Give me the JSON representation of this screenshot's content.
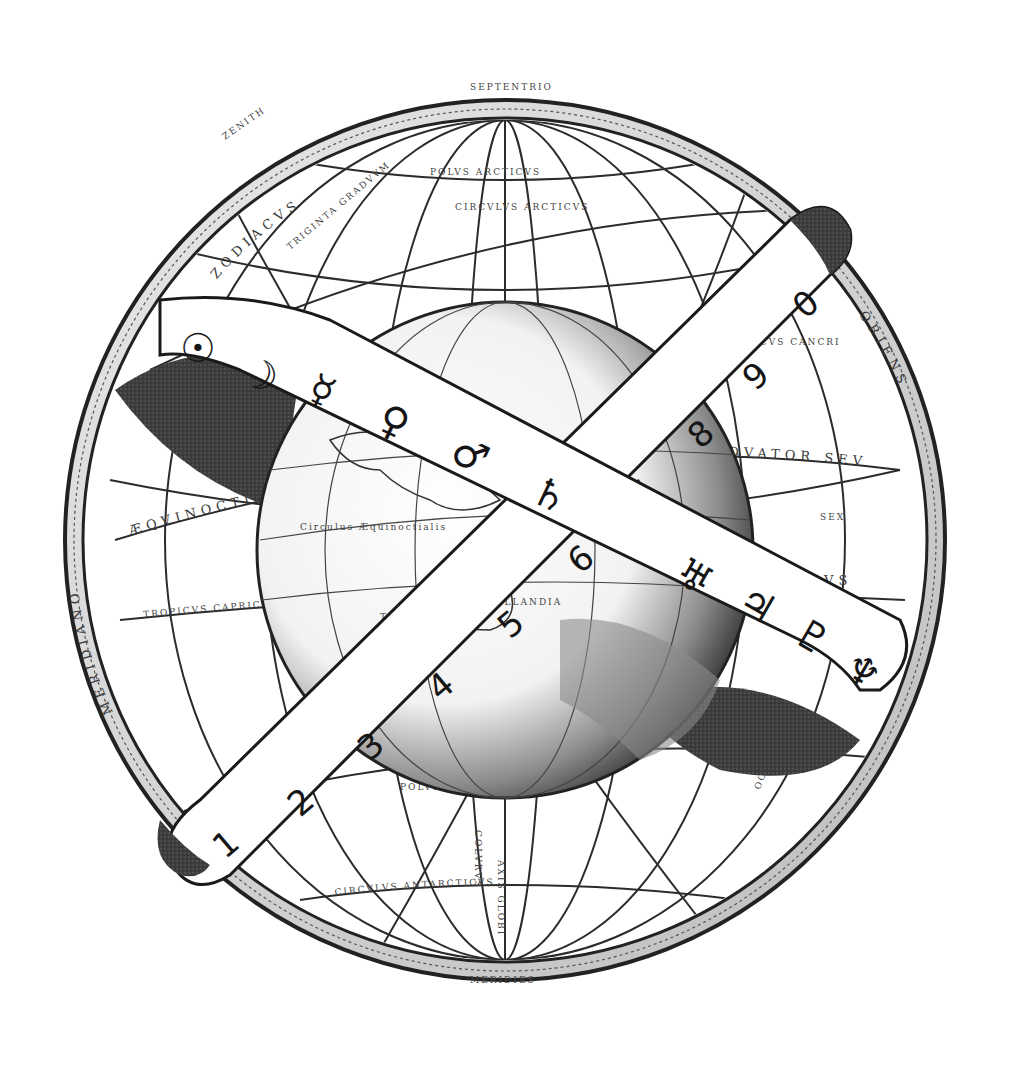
{
  "illustration": {
    "subject": "Armillary sphere engraving with globe, planetary ribbon and numbered ribbon",
    "palette": {
      "ink": "#151515",
      "shade": "#3b3b3b",
      "paper": "#ffffff",
      "line": "#2a2a2a"
    },
    "planet_ribbon": {
      "symbols": [
        {
          "name": "sun",
          "glyph": "☉"
        },
        {
          "name": "moon",
          "glyph": "☽"
        },
        {
          "name": "mercury",
          "glyph": "☿"
        },
        {
          "name": "venus",
          "glyph": "♀"
        },
        {
          "name": "mars",
          "glyph": "♂"
        },
        {
          "name": "saturn",
          "glyph": "♄"
        },
        {
          "name": "uranus",
          "glyph": "♅"
        },
        {
          "name": "jupiter",
          "glyph": "♃"
        },
        {
          "name": "pluto",
          "glyph": "♇"
        },
        {
          "name": "neptune",
          "glyph": "♆"
        }
      ]
    },
    "number_ribbon": {
      "numbers": [
        "1",
        "2",
        "3",
        "4",
        "5",
        "6",
        "7",
        "8",
        "9",
        "0"
      ]
    },
    "engraved_labels": {
      "top": "SEPTENTRIO",
      "bottom": "MERIDIES",
      "polus_arcticus": "POLVS ARCTICVS",
      "polus_antarcticus": "POLVS ANTARCTICVS",
      "circulus_arcticus": "CIRCVLVS ARCTICVS",
      "circulus_antarcticus": "CIRCVLVS ANTARCTICVS",
      "aequinoctialis": "ÆQVINOCTIALIS",
      "aequator": "ÆQVATOR SEV",
      "zodiacus": "ZODIACVS",
      "tropicus_cancri": "TROPICVS CANCRI",
      "tropicus_capricorni": "TROPICVS CAPRICORNI",
      "meridianus": "MERIDIANVS",
      "horizon": "HORIZON",
      "zenith": "ZENITH",
      "triginta_gradus": "TRIGINTA GRADVVM",
      "colurus": "COLVRVS",
      "axis_globi": "AXIS GLOBI",
      "nova_hollandia": "NOVA HOLLANDIA",
      "terra_australis": "TERRA AVSTRALIS INCOGNITA",
      "circulus_aequinoctialis": "Circulus Æquinoctialis",
      "tropicus": "Tropicus",
      "oriens": "ORIENS",
      "occidens": "OCCIDENS",
      "arcus": "ARCVS",
      "sex": "SEX",
      "meridiano": "MERIDIANO"
    }
  }
}
